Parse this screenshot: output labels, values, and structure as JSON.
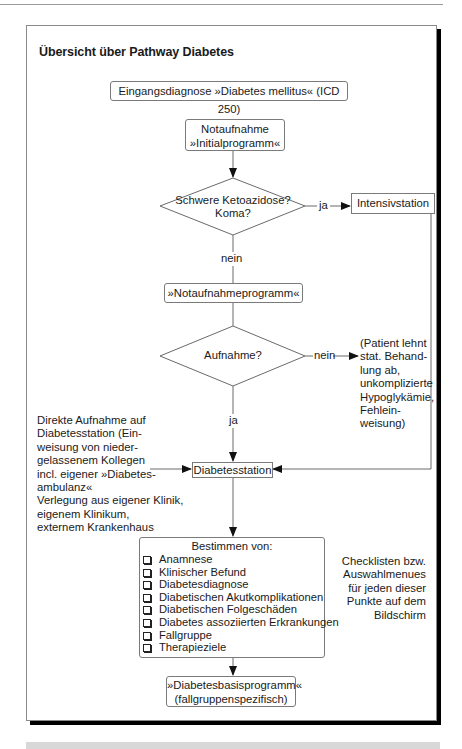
{
  "title": "Übersicht über Pathway Diabetes",
  "nodes": {
    "entry": "Eingangsdiagnose »Diabetes mellitus« (ICD 250)",
    "notaufnahme_line1": "Notaufnahme",
    "notaufnahme_line2": "»Initialprogramm«",
    "decision1_line1": "Schwere Ketoazidose?",
    "decision1_line2": "Koma?",
    "intensiv": "Intensivstation",
    "notaufnahmeprogramm": "»Notaufnahmeprogramm«",
    "decision2": "Aufnahme?",
    "diabetesstation": "Diabetesstation",
    "bestimmen_header": "Bestimmen von:",
    "final_line1": "»Diabetesbasisprogramm«",
    "final_line2": "(fallgruppenspezifisch)"
  },
  "edge_labels": {
    "d1_yes": "ja",
    "d1_no": "nein",
    "d2_no": "nein",
    "d2_yes": "ja"
  },
  "checklist": [
    "Anamnese",
    "Klinischer Befund",
    "Diabetesdiagnose",
    "Diabetischen Akutkomplikationen",
    "Diabetischen Folgeschäden",
    "Diabetes assoziierten Erkrankungen",
    "Fallgruppe",
    "Therapieziele"
  ],
  "notes": {
    "rejection": [
      "(Patient lehnt",
      "stat. Behand-",
      "lung ab,",
      "unkomplizierte",
      "Hypoglykämie,",
      "Fehlein-",
      "weisung)"
    ],
    "direct_admission": [
      "Direkte Aufnahme auf",
      "Diabetesstation (Ein-",
      "weisung von nieder-",
      "gelassenem Kollegen",
      "incl. eigener »Diabetes-",
      "ambulanz«",
      "Verlegung aus eigener Klinik,",
      "eigenem Klinikum,",
      "externem Krankenhaus"
    ],
    "checklist_hint": [
      "Checklisten bzw.",
      "Auswahlmenues",
      "für jeden dieser",
      "Punkte auf dem",
      "Bildschirm"
    ]
  }
}
